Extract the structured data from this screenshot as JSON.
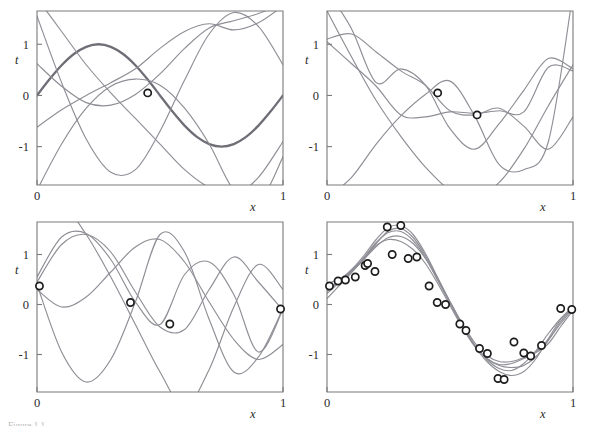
{
  "figure": {
    "background": "#ffffff",
    "curve_color": "#8e8e96",
    "true_curve_color": "#6e6e76",
    "axis_color": "#7a7a7a",
    "marker_edge_color": "#1c1c1c",
    "marker_face_color": "#ffffff",
    "caption_partial": "Figure 1.1"
  },
  "chart_data": [
    {
      "type": "line",
      "panel": "top-left",
      "title": "",
      "xlabel": "x",
      "ylabel": "t",
      "xlim": [
        0,
        1
      ],
      "ylim": [
        -1.75,
        1.65
      ],
      "xticks": [
        0,
        1
      ],
      "xticklabels": [
        "0",
        "1"
      ],
      "yticks": [
        -1,
        0,
        1
      ],
      "yticklabels": [
        "-1",
        "0",
        "1"
      ],
      "grid": false,
      "legend": "none",
      "observed_points": [
        {
          "x": 0.45,
          "y": 0.05
        }
      ],
      "series": [
        {
          "name": "true-sine",
          "style": "thick",
          "points_x": [
            0.0,
            0.05,
            0.1,
            0.15,
            0.2,
            0.25,
            0.3,
            0.35,
            0.4,
            0.45,
            0.5,
            0.55,
            0.6,
            0.65,
            0.7,
            0.75,
            0.8,
            0.85,
            0.9,
            0.95,
            1.0
          ],
          "points_y": [
            0.0,
            0.31,
            0.59,
            0.81,
            0.95,
            1.0,
            0.95,
            0.81,
            0.59,
            0.31,
            0.0,
            -0.31,
            -0.59,
            -0.81,
            -0.95,
            -1.0,
            -0.95,
            -0.81,
            -0.59,
            -0.31,
            0.0
          ]
        },
        {
          "name": "sample-1",
          "style": "thin",
          "points_x": [
            0.0,
            0.1,
            0.2,
            0.3,
            0.4,
            0.5,
            0.6,
            0.7,
            0.8,
            0.9,
            1.0
          ],
          "points_y": [
            0.62,
            0.18,
            -0.14,
            -0.19,
            0.02,
            0.42,
            0.92,
            1.32,
            1.46,
            1.6,
            1.8
          ]
        },
        {
          "name": "sample-2",
          "style": "thin",
          "points_x": [
            0.0,
            0.1,
            0.2,
            0.3,
            0.4,
            0.5,
            0.6,
            0.7,
            0.8,
            0.9,
            1.0
          ],
          "points_y": [
            1.9,
            1.25,
            0.6,
            0.05,
            -0.45,
            -0.95,
            -1.45,
            -1.8,
            -1.95,
            -1.6,
            -0.9
          ]
        },
        {
          "name": "sample-3",
          "style": "thin",
          "points_x": [
            0.0,
            0.1,
            0.2,
            0.3,
            0.4,
            0.5,
            0.6,
            0.7,
            0.8,
            0.9,
            1.0
          ],
          "points_y": [
            1.55,
            0.25,
            -0.85,
            -1.5,
            -1.45,
            -0.7,
            0.3,
            1.2,
            1.62,
            1.35,
            0.6
          ]
        },
        {
          "name": "sample-4",
          "style": "thin",
          "points_x": [
            0.0,
            0.1,
            0.2,
            0.3,
            0.4,
            0.5,
            0.6,
            0.7,
            0.8,
            0.9,
            1.0
          ],
          "points_y": [
            -1.85,
            -0.95,
            -0.25,
            0.18,
            0.32,
            0.2,
            -0.25,
            -0.95,
            -1.85,
            -2.1,
            -1.2
          ]
        },
        {
          "name": "sample-5",
          "style": "thin",
          "points_x": [
            0.0,
            0.1,
            0.2,
            0.3,
            0.4,
            0.5,
            0.6,
            0.7,
            0.8,
            0.9,
            1.0
          ],
          "points_y": [
            -0.62,
            -0.28,
            0.0,
            0.25,
            0.52,
            0.92,
            1.25,
            1.4,
            1.28,
            1.42,
            1.75
          ]
        }
      ]
    },
    {
      "type": "line",
      "panel": "top-right",
      "title": "",
      "xlabel": "x",
      "ylabel": "t",
      "xlim": [
        0,
        1
      ],
      "ylim": [
        -1.75,
        1.65
      ],
      "xticks": [
        0,
        1
      ],
      "xticklabels": [
        "0",
        "1"
      ],
      "yticks": [
        -1,
        0,
        1
      ],
      "yticklabels": [
        "-1",
        "0",
        "1"
      ],
      "grid": false,
      "legend": "none",
      "observed_points": [
        {
          "x": 0.45,
          "y": 0.05
        },
        {
          "x": 0.61,
          "y": -0.38
        }
      ],
      "series": [
        {
          "name": "sample-1",
          "style": "thin",
          "points_x": [
            0.0,
            0.1,
            0.2,
            0.3,
            0.4,
            0.5,
            0.6,
            0.7,
            0.8,
            0.9,
            1.0
          ],
          "points_y": [
            1.1,
            1.2,
            0.85,
            0.48,
            0.2,
            -0.3,
            -0.38,
            -0.25,
            -0.6,
            -1.05,
            -0.42
          ]
        },
        {
          "name": "sample-2",
          "style": "thin",
          "points_x": [
            0.0,
            0.1,
            0.2,
            0.3,
            0.4,
            0.5,
            0.6,
            0.7,
            0.8,
            0.9,
            1.0
          ],
          "points_y": [
            1.05,
            0.62,
            0.18,
            -0.38,
            -0.42,
            -0.32,
            -0.35,
            -0.3,
            -0.32,
            0.55,
            0.48
          ]
        },
        {
          "name": "sample-3",
          "style": "thin",
          "points_x": [
            0.0,
            0.1,
            0.2,
            0.3,
            0.4,
            0.5,
            0.6,
            0.7,
            0.8,
            0.9,
            1.0
          ],
          "points_y": [
            1.65,
            0.75,
            -0.1,
            -0.8,
            -1.4,
            -1.85,
            -2.0,
            -1.7,
            -1.05,
            -0.2,
            0.6
          ]
        },
        {
          "name": "sample-4",
          "style": "thin",
          "points_x": [
            0.0,
            0.1,
            0.2,
            0.3,
            0.4,
            0.5,
            0.6,
            0.7,
            0.8,
            0.9,
            1.0
          ],
          "points_y": [
            2.05,
            1.3,
            0.25,
            0.52,
            0.2,
            -0.65,
            -1.05,
            -0.55,
            0.1,
            0.72,
            0.52
          ]
        },
        {
          "name": "sample-5",
          "style": "thin",
          "points_x": [
            0.0,
            0.1,
            0.2,
            0.3,
            0.4,
            0.5,
            0.6,
            0.7,
            0.8,
            0.9,
            1.0
          ],
          "points_y": [
            -2.0,
            -1.6,
            -0.95,
            -0.4,
            0.02,
            0.28,
            -0.4,
            -1.35,
            -1.45,
            -0.9,
            2.0
          ]
        }
      ]
    },
    {
      "type": "line",
      "panel": "bottom-left",
      "title": "",
      "xlabel": "x",
      "ylabel": "t",
      "xlim": [
        0,
        1
      ],
      "ylim": [
        -1.75,
        1.65
      ],
      "xticks": [
        0,
        1
      ],
      "xticklabels": [
        "0",
        "1"
      ],
      "yticks": [
        -1,
        0,
        1
      ],
      "yticklabels": [
        "-1",
        "0",
        "1"
      ],
      "grid": false,
      "legend": "none",
      "observed_points": [
        {
          "x": 0.01,
          "y": 0.37
        },
        {
          "x": 0.38,
          "y": 0.04
        },
        {
          "x": 0.54,
          "y": -0.39
        },
        {
          "x": 0.99,
          "y": -0.09
        }
      ],
      "series": [
        {
          "name": "sample-1",
          "style": "thin",
          "points_x": [
            0.0,
            0.1,
            0.2,
            0.3,
            0.4,
            0.5,
            0.6,
            0.7,
            0.8,
            0.9,
            1.0
          ],
          "points_y": [
            0.3,
            -0.05,
            0.15,
            0.65,
            1.15,
            1.3,
            0.85,
            0.05,
            -0.7,
            -1.1,
            -0.8
          ]
        },
        {
          "name": "sample-2",
          "style": "thin",
          "points_x": [
            0.0,
            0.1,
            0.2,
            0.3,
            0.4,
            0.5,
            0.6,
            0.7,
            0.8,
            0.9,
            1.0
          ],
          "points_y": [
            0.45,
            1.2,
            1.4,
            1.05,
            0.25,
            -0.45,
            -0.5,
            0.3,
            0.95,
            0.45,
            -0.12
          ]
        },
        {
          "name": "sample-3",
          "style": "thin",
          "points_x": [
            0.0,
            0.1,
            0.2,
            0.3,
            0.4,
            0.5,
            0.6,
            0.7,
            0.8,
            0.9,
            1.0
          ],
          "points_y": [
            0.55,
            1.35,
            1.42,
            0.9,
            0.05,
            -0.4,
            0.6,
            0.85,
            0.2,
            -0.95,
            -0.1
          ]
        },
        {
          "name": "sample-4",
          "style": "thin",
          "points_x": [
            0.0,
            0.1,
            0.2,
            0.3,
            0.4,
            0.5,
            0.6,
            0.7,
            0.8,
            0.9,
            1.0
          ],
          "points_y": [
            0.4,
            -0.95,
            -1.55,
            -1.1,
            0.05,
            1.4,
            1.05,
            -0.3,
            -1.35,
            -1.05,
            -0.08
          ]
        },
        {
          "name": "sample-5",
          "style": "thin",
          "points_x": [
            0.0,
            0.1,
            0.2,
            0.3,
            0.4,
            0.5,
            0.6,
            0.7,
            0.8,
            0.9,
            1.0
          ],
          "points_y": [
            1.85,
            2.0,
            1.4,
            0.55,
            -0.4,
            -1.35,
            -2.05,
            -1.3,
            -0.05,
            0.8,
            0.3
          ]
        }
      ]
    },
    {
      "type": "line",
      "panel": "bottom-right",
      "title": "",
      "xlabel": "x",
      "ylabel": "t",
      "xlim": [
        0,
        1
      ],
      "ylim": [
        -1.75,
        1.65
      ],
      "xticks": [
        0,
        1
      ],
      "xticklabels": [
        "0",
        "1"
      ],
      "yticks": [
        -1,
        0,
        1
      ],
      "yticklabels": [
        "-1",
        "0",
        "1"
      ],
      "grid": false,
      "legend": "none",
      "observed_points": [
        {
          "x": 0.01,
          "y": 0.37
        },
        {
          "x": 0.045,
          "y": 0.47
        },
        {
          "x": 0.075,
          "y": 0.49
        },
        {
          "x": 0.115,
          "y": 0.55
        },
        {
          "x": 0.155,
          "y": 0.78
        },
        {
          "x": 0.165,
          "y": 0.82
        },
        {
          "x": 0.195,
          "y": 0.66
        },
        {
          "x": 0.245,
          "y": 1.55
        },
        {
          "x": 0.265,
          "y": 1.0
        },
        {
          "x": 0.3,
          "y": 1.58
        },
        {
          "x": 0.33,
          "y": 0.92
        },
        {
          "x": 0.365,
          "y": 0.95
        },
        {
          "x": 0.415,
          "y": 0.37
        },
        {
          "x": 0.448,
          "y": 0.04
        },
        {
          "x": 0.482,
          "y": 0.0
        },
        {
          "x": 0.54,
          "y": -0.39
        },
        {
          "x": 0.565,
          "y": -0.52
        },
        {
          "x": 0.62,
          "y": -0.88
        },
        {
          "x": 0.652,
          "y": -0.98
        },
        {
          "x": 0.695,
          "y": -1.48
        },
        {
          "x": 0.72,
          "y": -1.5
        },
        {
          "x": 0.76,
          "y": -0.75
        },
        {
          "x": 0.8,
          "y": -0.97
        },
        {
          "x": 0.828,
          "y": -1.03
        },
        {
          "x": 0.872,
          "y": -0.82
        },
        {
          "x": 0.95,
          "y": -0.08
        },
        {
          "x": 0.995,
          "y": -0.1
        }
      ],
      "series": [
        {
          "name": "sample-1",
          "style": "thin",
          "points_x": [
            0.0,
            0.05,
            0.1,
            0.15,
            0.2,
            0.25,
            0.3,
            0.35,
            0.4,
            0.45,
            0.5,
            0.55,
            0.6,
            0.65,
            0.7,
            0.75,
            0.8,
            0.85,
            0.9,
            0.95,
            1.0
          ],
          "points_y": [
            0.22,
            0.44,
            0.66,
            0.92,
            1.22,
            1.47,
            1.52,
            1.34,
            0.98,
            0.52,
            0.05,
            -0.4,
            -0.8,
            -1.1,
            -1.28,
            -1.32,
            -1.18,
            -0.92,
            -0.58,
            -0.28,
            -0.05
          ]
        },
        {
          "name": "sample-2",
          "style": "thin",
          "points_x": [
            0.0,
            0.05,
            0.1,
            0.15,
            0.2,
            0.25,
            0.3,
            0.35,
            0.4,
            0.45,
            0.5,
            0.55,
            0.6,
            0.65,
            0.7,
            0.75,
            0.8,
            0.85,
            0.9,
            0.95,
            1.0
          ],
          "points_y": [
            0.4,
            0.52,
            0.66,
            0.9,
            1.16,
            1.34,
            1.36,
            1.22,
            0.92,
            0.5,
            0.06,
            -0.38,
            -0.76,
            -1.02,
            -1.14,
            -1.14,
            -1.06,
            -0.94,
            -0.7,
            -0.38,
            -0.08
          ]
        },
        {
          "name": "sample-3",
          "style": "thin",
          "points_x": [
            0.0,
            0.05,
            0.1,
            0.15,
            0.2,
            0.25,
            0.3,
            0.35,
            0.4,
            0.45,
            0.5,
            0.55,
            0.6,
            0.65,
            0.7,
            0.75,
            0.8,
            0.85,
            0.9,
            0.95,
            1.0
          ],
          "points_y": [
            0.12,
            0.38,
            0.64,
            0.92,
            1.18,
            1.3,
            1.26,
            1.1,
            0.82,
            0.42,
            -0.02,
            -0.46,
            -0.84,
            -1.14,
            -1.34,
            -1.42,
            -1.34,
            -1.08,
            -0.68,
            -0.3,
            -0.04
          ]
        },
        {
          "name": "sample-4",
          "style": "thin",
          "points_x": [
            0.0,
            0.05,
            0.1,
            0.15,
            0.2,
            0.25,
            0.3,
            0.35,
            0.4,
            0.45,
            0.5,
            0.55,
            0.6,
            0.65,
            0.7,
            0.75,
            0.8,
            0.85,
            0.9,
            0.95,
            1.0
          ],
          "points_y": [
            0.3,
            0.48,
            0.7,
            0.98,
            1.3,
            1.54,
            1.58,
            1.4,
            1.02,
            0.54,
            0.05,
            -0.42,
            -0.82,
            -1.08,
            -1.2,
            -1.18,
            -1.08,
            -0.96,
            -0.78,
            -0.44,
            -0.12
          ]
        },
        {
          "name": "sample-5",
          "style": "thin",
          "points_x": [
            0.0,
            0.05,
            0.1,
            0.15,
            0.2,
            0.25,
            0.3,
            0.35,
            0.4,
            0.45,
            0.5,
            0.55,
            0.6,
            0.65,
            0.7,
            0.75,
            0.8,
            0.85,
            0.9,
            0.95,
            1.0
          ],
          "points_y": [
            0.26,
            0.46,
            0.68,
            0.94,
            1.24,
            1.44,
            1.46,
            1.28,
            0.94,
            0.48,
            0.02,
            -0.44,
            -0.82,
            -1.08,
            -1.22,
            -1.26,
            -1.22,
            -1.04,
            -0.72,
            -0.34,
            -0.06
          ]
        }
      ]
    }
  ]
}
